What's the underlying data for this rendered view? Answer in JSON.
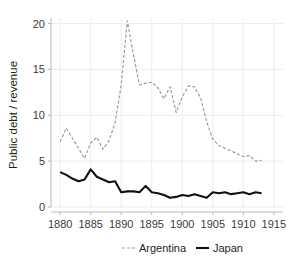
{
  "chart_data": {
    "type": "line",
    "title": "",
    "subtitle": "",
    "xlabel": "",
    "ylabel": "Public debt / revenue",
    "xlim": [
      1878.5,
      1916.5
    ],
    "ylim": [
      0,
      20.6
    ],
    "xticks": [
      1880,
      1885,
      1890,
      1895,
      1900,
      1905,
      1910,
      1915
    ],
    "xtick_labels": [
      "1880",
      "1885",
      "1890",
      "1895",
      "1900",
      "1905",
      "1910",
      "1915"
    ],
    "yticks": [
      0,
      5,
      10,
      15,
      20
    ],
    "ytick_labels": [
      "0",
      "5",
      "10",
      "15",
      "20"
    ],
    "grid": "horizontal-and-vertical-faint",
    "legend_position": "bottom-center",
    "x": [
      1880,
      1881,
      1882,
      1883,
      1884,
      1885,
      1886,
      1887,
      1888,
      1889,
      1890,
      1891,
      1892,
      1893,
      1894,
      1895,
      1896,
      1897,
      1898,
      1899,
      1900,
      1901,
      1902,
      1903,
      1904,
      1905,
      1906,
      1907,
      1908,
      1909,
      1910,
      1911,
      1912,
      1913
    ],
    "series": [
      {
        "name": "Argentina",
        "color": "#9a9a9a",
        "style": "dashed",
        "values": [
          7.1,
          8.6,
          7.5,
          6.4,
          5.3,
          7.0,
          7.6,
          6.3,
          7.2,
          9.2,
          13.3,
          20.3,
          16.6,
          13.3,
          13.5,
          13.6,
          13.0,
          11.8,
          13.1,
          10.3,
          12.0,
          13.2,
          13.1,
          11.9,
          9.3,
          7.4,
          6.7,
          6.4,
          6.1,
          5.8,
          5.5,
          5.6,
          5.0,
          5.1
        ]
      },
      {
        "name": "Japan",
        "color": "#111111",
        "style": "solid",
        "values": [
          3.8,
          3.5,
          3.1,
          2.8,
          3.0,
          4.1,
          3.3,
          3.0,
          2.7,
          2.8,
          1.6,
          1.7,
          1.7,
          1.6,
          2.3,
          1.6,
          1.5,
          1.3,
          1.0,
          1.1,
          1.3,
          1.2,
          1.4,
          1.2,
          1.0,
          1.6,
          1.5,
          1.6,
          1.4,
          1.5,
          1.6,
          1.4,
          1.6,
          1.5
        ]
      }
    ]
  },
  "legend": {
    "items": [
      {
        "label": "Argentina",
        "swatch": "dashed-gray-line"
      },
      {
        "label": "Japan",
        "swatch": "solid-black-line"
      }
    ]
  }
}
